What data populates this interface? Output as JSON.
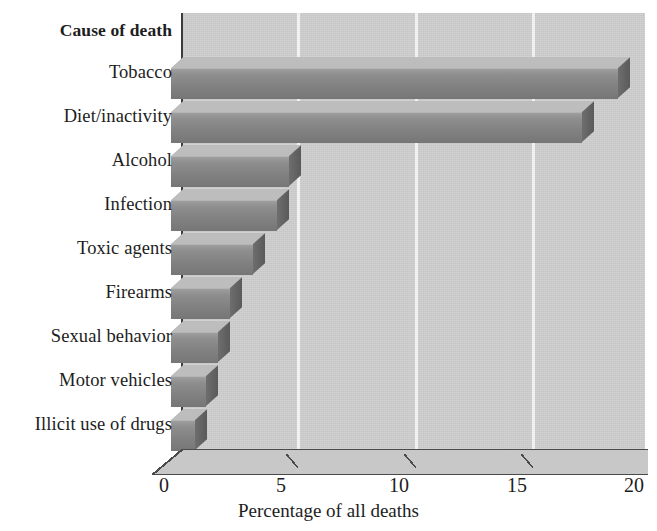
{
  "chart_data": {
    "type": "bar",
    "orientation": "horizontal",
    "title": "",
    "category_axis_title": "Cause of death",
    "xlabel": "Percentage of all deaths",
    "ylabel": "",
    "xlim": [
      0,
      20
    ],
    "xticks": [
      0,
      5,
      10,
      15,
      20
    ],
    "xtick_labels": [
      "0",
      "5",
      "10",
      "15",
      "20"
    ],
    "grid": true,
    "legend": false,
    "style": "3d-bar",
    "categories": [
      "Tobacco",
      "Diet/inactivity",
      "Alcohol",
      "Infection",
      "Toxic agents",
      "Firearms",
      "Sexual behavior",
      "Motor vehicles",
      "Illicit use of drugs"
    ],
    "values": [
      19,
      17.5,
      5,
      4.5,
      3.5,
      2.5,
      2,
      1.5,
      1
    ],
    "series": [
      {
        "name": "Percentage of all deaths",
        "values": [
          19,
          17.5,
          5,
          4.5,
          3.5,
          2.5,
          2,
          1.5,
          1
        ]
      }
    ]
  },
  "colors": {
    "plot_background": "#cfcfcf",
    "gridline": "#f0f0f0",
    "bar_front": "#888888",
    "bar_top": "#bdbdbd",
    "bar_side": "#5f5f5f",
    "axis_line": "#3c3c3c",
    "text": "#1d1d1d",
    "page_background": "#ffffff"
  },
  "axis": {
    "category_header": "Cause of death",
    "x_title": "Percentage of all deaths",
    "x_tick_labels": [
      "0",
      "5",
      "10",
      "15",
      "20"
    ]
  }
}
